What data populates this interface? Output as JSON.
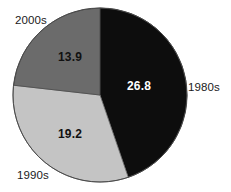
{
  "chart_data": {
    "type": "pie",
    "title": "",
    "categories": [
      "1980s",
      "1990s",
      "2000s"
    ],
    "values": [
      26.8,
      19.2,
      13.9
    ],
    "value_labels": [
      "26.8",
      "19.2",
      "13.9"
    ],
    "colors": [
      "#0d0d0d",
      "#c4c4c4",
      "#6b6b6b"
    ],
    "label_text_colors": [
      "#ffffff",
      "#111111",
      "#111111"
    ],
    "legend": "none",
    "grid": false,
    "start_angle_deg": 0,
    "direction": "clockwise",
    "total": 59.9,
    "slices": [
      {
        "name": "1980s",
        "value": 26.8,
        "value_label": "26.8",
        "color": "#0d0d0d",
        "label_color": "#ffffff",
        "category_label": "1980s",
        "category_label_position": "right"
      },
      {
        "name": "1990s",
        "value": 19.2,
        "value_label": "19.2",
        "color": "#c4c4c4",
        "label_color": "#111111",
        "category_label": "1990s",
        "category_label_position": "bottom-left"
      },
      {
        "name": "2000s",
        "value": 13.9,
        "value_label": "13.9",
        "color": "#6b6b6b",
        "label_color": "#111111",
        "category_label": "2000s",
        "category_label_position": "top-left"
      }
    ],
    "geometry": {
      "center_x": 100,
      "center_y": 95,
      "radius": 87,
      "outline_color": "#3a3a3a"
    }
  }
}
